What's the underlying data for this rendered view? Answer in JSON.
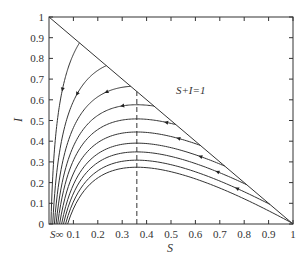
{
  "chart_data": {
    "type": "line",
    "title": "",
    "xlabel": "S",
    "ylabel": "I",
    "xlim": [
      0,
      1
    ],
    "ylim": [
      0,
      1
    ],
    "grid": false,
    "x_ticks": [
      "0.1",
      "0.2",
      "0.3",
      "0.4",
      "0.5",
      "0.6",
      "0.7",
      "0.8",
      "0.9",
      "1"
    ],
    "y_ticks": [
      "0",
      "0.1",
      "0.2",
      "0.3",
      "0.4",
      "0.5",
      "0.6",
      "0.7",
      "0.8",
      "0.9",
      "1"
    ],
    "x_origin_label": "S∞",
    "annotations": [
      {
        "text": "S+I=1",
        "x": 0.52,
        "y": 0.63,
        "kind": "line-label"
      },
      {
        "text": "dashed vertical line",
        "x": 0.36,
        "kind": "threshold S=1/R0"
      }
    ],
    "boundary_line": {
      "name": "S+I=1",
      "points": [
        [
          0,
          1
        ],
        [
          1,
          0
        ]
      ]
    },
    "threshold_S": 0.36,
    "model": "SIR phase trajectories: I = 1 - S + (1/R0) ln(S/S0), R0 ≈ 2.78",
    "R0": 2.78,
    "trajectories": [
      {
        "S0": 0.125,
        "I0": 0.875,
        "arrow_at_S": 0.055,
        "peak_I": null
      },
      {
        "S0": 0.235,
        "I0": 0.765,
        "arrow_at_S": 0.115,
        "peak_I": null
      },
      {
        "S0": 0.335,
        "I0": 0.665,
        "arrow_at_S": 0.235,
        "peak_I": 0.67
      },
      {
        "S0": 0.43,
        "I0": 0.57,
        "arrow_at_S": 0.3,
        "peak_I": 0.61
      },
      {
        "S0": 0.52,
        "I0": 0.48,
        "arrow_at_S": 0.48,
        "peak_I": 0.53
      },
      {
        "S0": 0.62,
        "I0": 0.38,
        "arrow_at_S": 0.53,
        "peak_I": 0.47
      },
      {
        "S0": 0.72,
        "I0": 0.28,
        "arrow_at_S": 0.62,
        "peak_I": 0.42
      },
      {
        "S0": 0.81,
        "I0": 0.19,
        "arrow_at_S": 0.69,
        "peak_I": 0.38
      },
      {
        "S0": 0.905,
        "I0": 0.095,
        "arrow_at_S": 0.77,
        "peak_I": 0.34
      },
      {
        "S0": 0.995,
        "I0": 0.005,
        "arrow_at_S": 0.0,
        "peak_I": 0.31
      }
    ]
  }
}
